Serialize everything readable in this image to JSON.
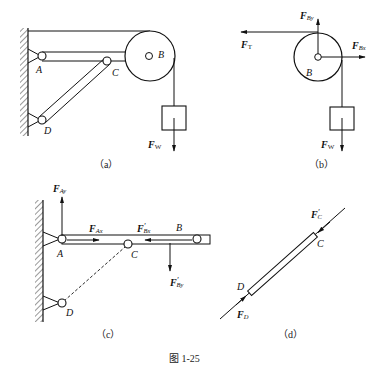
{
  "figure": {
    "caption": "图 1-25",
    "panels": [
      {
        "id": "a",
        "label": "（a）",
        "points": {
          "A": "A",
          "B": "B",
          "C": "C",
          "D": "D"
        },
        "forces": {
          "weight": {
            "main": "F",
            "sub": "W"
          }
        }
      },
      {
        "id": "b",
        "label": "（b）",
        "points": {
          "B": "B"
        },
        "forces": {
          "tension": {
            "main": "F",
            "sub": "T"
          },
          "by": {
            "main": "F",
            "sub": "By"
          },
          "bx": {
            "main": "F",
            "sub": "Bx"
          },
          "weight": {
            "main": "F",
            "sub": "W"
          }
        }
      },
      {
        "id": "c",
        "label": "（c）",
        "points": {
          "A": "A",
          "B": "B",
          "C": "C",
          "D": "D"
        },
        "forces": {
          "ay": {
            "main": "F",
            "sub": "Ay"
          },
          "ax": {
            "main": "F",
            "sub": "Ax"
          },
          "bx_prime": {
            "main": "F",
            "prime": "′",
            "sub": "Bx"
          },
          "by_prime": {
            "main": "F",
            "prime": "′",
            "sub": "By"
          }
        }
      },
      {
        "id": "d",
        "label": "（d）",
        "points": {
          "C": "C",
          "D": "D"
        },
        "forces": {
          "c_prime": {
            "main": "F",
            "prime": "′",
            "sub": "C"
          },
          "d": {
            "main": "F",
            "sub": "D"
          }
        }
      }
    ]
  }
}
